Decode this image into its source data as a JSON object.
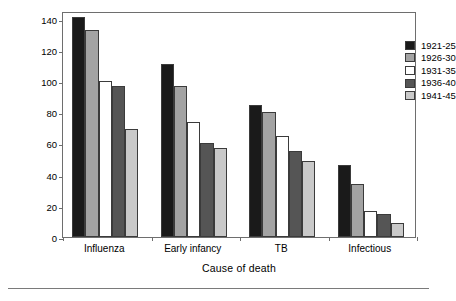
{
  "chart_data": {
    "type": "bar",
    "title": "",
    "xlabel": "Cause of death",
    "ylabel": "Death rate",
    "categories": [
      "Influenza",
      "Early infancy",
      "TB",
      "Infectious"
    ],
    "series": [
      {
        "name": "1921-25",
        "color": "#1a1a1a",
        "values": [
          141,
          111,
          85,
          46
        ]
      },
      {
        "name": "1926-30",
        "color": "#a3a3a3",
        "values": [
          133,
          97,
          80,
          34
        ]
      },
      {
        "name": "1931-35",
        "color": "#ffffff",
        "values": [
          100,
          74,
          65,
          17
        ]
      },
      {
        "name": "1936-40",
        "color": "#555555",
        "values": [
          97,
          60,
          55,
          15
        ]
      },
      {
        "name": "1941-45",
        "color": "#c9c9c9",
        "values": [
          69,
          57,
          49,
          9
        ]
      }
    ],
    "ylim": [
      0,
      145
    ],
    "yticks": [
      0,
      20,
      40,
      60,
      80,
      100,
      120,
      140
    ],
    "grid": false,
    "legend_position": "top-right"
  },
  "legend": {
    "entries": [
      {
        "label": "1921-25"
      },
      {
        "label": "1926-30"
      },
      {
        "label": "1931-35"
      },
      {
        "label": "1936-40"
      },
      {
        "label": "1941-45"
      }
    ]
  }
}
